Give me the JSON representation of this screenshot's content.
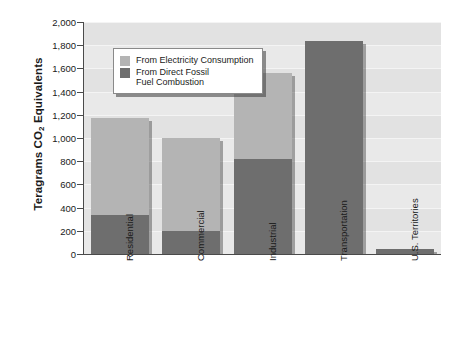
{
  "chart_data": {
    "type": "bar",
    "subtype": "stacked-bar",
    "title": "",
    "xlabel": "",
    "ylabel": "Teragrams CO₂ Equivalents",
    "ylim": [
      0,
      2000
    ],
    "ytick_step": 200,
    "ytick_labels": [
      "0",
      "200",
      "400",
      "600",
      "800",
      "1,000",
      "1,200",
      "1,400",
      "1,600",
      "1,800",
      "2,000"
    ],
    "ytick_values": [
      0,
      200,
      400,
      600,
      800,
      1000,
      1200,
      1400,
      1600,
      1800,
      2000
    ],
    "grid": true,
    "grid_orientation": "horizontal",
    "legend_position": "upper-left-inside",
    "categories": [
      "Residential",
      "Commercial",
      "Industrial",
      "Transportation",
      "U.S. Territories"
    ],
    "series": [
      {
        "name": "From Direct Fossil\nFuel Combustion",
        "color": "#6e6e6e",
        "values": [
          335,
          200,
          820,
          1840,
          45
        ]
      },
      {
        "name": "From Electricity Consumption",
        "color": "#b4b4b4",
        "values": [
          835,
          800,
          740,
          0,
          0
        ]
      }
    ],
    "totals": [
      1170,
      1000,
      1560,
      1840,
      45
    ]
  },
  "legend": {
    "items": [
      {
        "label": "From Electricity Consumption",
        "color": "#b4b4b4",
        "swatch_name": "legend-swatch-electricity"
      },
      {
        "label": "From Direct Fossil\nFuel Combustion",
        "color": "#6e6e6e",
        "swatch_name": "legend-swatch-fossil"
      }
    ]
  },
  "axes": {
    "y_title_prefix": "Teragrams CO",
    "y_title_sub": "2",
    "y_title_suffix": " Equivalents"
  }
}
